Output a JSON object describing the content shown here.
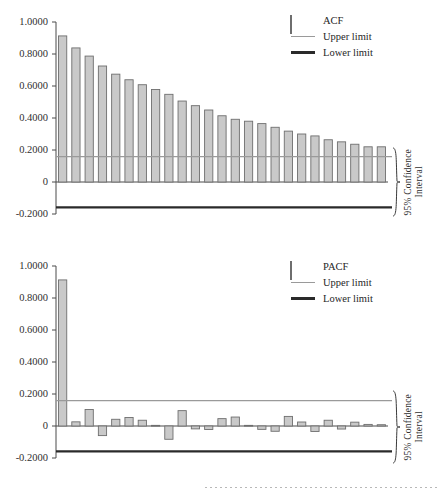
{
  "figure": {
    "background_color": "#ffffff",
    "bar_fill": "#c9c9c9",
    "bar_stroke": "#6e6e6e",
    "upper_limit_color": "#9a9a9a",
    "lower_limit_color": "#2a2a2a",
    "axis_color": "#4a4a4a"
  },
  "charts": [
    {
      "id": "acf",
      "type": "bar",
      "title": "",
      "xlabel": "",
      "ylabel": "",
      "ylim": [
        -0.2,
        1.0
      ],
      "grid": false,
      "tick_labels": [
        "1.0000",
        "0.8000",
        "0.6000",
        "0.4000",
        "0.2000",
        "0",
        "-0.2000"
      ],
      "tick_values": [
        1.0,
        0.8,
        0.6,
        0.4,
        0.2,
        0.0,
        -0.2
      ],
      "legend": {
        "position": "top-right",
        "entries": [
          {
            "label": "ACF",
            "key": "swatch"
          },
          {
            "label": "Upper limit",
            "key": "line-upper"
          },
          {
            "label": "Lower limit",
            "key": "line-lower"
          }
        ]
      },
      "annotation": {
        "line1": "95% Confidence",
        "line2": "Interval",
        "brace": "curly-brace-right"
      },
      "series_name": "ACF",
      "lags": [
        1,
        2,
        3,
        4,
        5,
        6,
        7,
        8,
        9,
        10,
        11,
        12,
        13,
        14,
        15,
        16,
        17,
        18,
        19,
        20,
        21,
        22,
        23,
        24,
        25
      ],
      "values": [
        0.913,
        0.838,
        0.787,
        0.725,
        0.674,
        0.639,
        0.608,
        0.578,
        0.548,
        0.506,
        0.477,
        0.45,
        0.414,
        0.392,
        0.38,
        0.365,
        0.342,
        0.318,
        0.3,
        0.288,
        0.264,
        0.251,
        0.236,
        0.22,
        0.22
      ],
      "upper_limit": 0.158,
      "lower_limit": -0.158
    },
    {
      "id": "pacf",
      "type": "bar",
      "title": "",
      "xlabel": "",
      "ylabel": "",
      "ylim": [
        -0.2,
        1.0
      ],
      "grid": false,
      "tick_labels": [
        "1.0000",
        "0.8000",
        "0.6000",
        "0.4000",
        "0.2000",
        "0",
        "-0.2000"
      ],
      "tick_values": [
        1.0,
        0.8,
        0.6,
        0.4,
        0.2,
        0.0,
        -0.2
      ],
      "legend": {
        "position": "top-right",
        "entries": [
          {
            "label": "PACF",
            "key": "swatch"
          },
          {
            "label": "Upper limit",
            "key": "line-upper"
          },
          {
            "label": "Lower limit",
            "key": "line-lower"
          }
        ]
      },
      "annotation": {
        "line1": "95% Confidence",
        "line2": "Interval",
        "brace": "curly-brace-right"
      },
      "series_name": "PACF",
      "lags": [
        1,
        2,
        3,
        4,
        5,
        6,
        7,
        8,
        9,
        10,
        11,
        12,
        13,
        14,
        15,
        16,
        17,
        18,
        19,
        20,
        21,
        22,
        23,
        24,
        25
      ],
      "values": [
        0.913,
        0.026,
        0.103,
        -0.06,
        0.042,
        0.053,
        0.036,
        0.004,
        -0.083,
        0.096,
        -0.018,
        -0.022,
        0.046,
        0.056,
        0.004,
        -0.021,
        -0.033,
        0.06,
        0.025,
        -0.034,
        0.036,
        -0.019,
        0.024,
        0.01,
        0.008
      ],
      "upper_limit": 0.158,
      "lower_limit": -0.158
    }
  ]
}
